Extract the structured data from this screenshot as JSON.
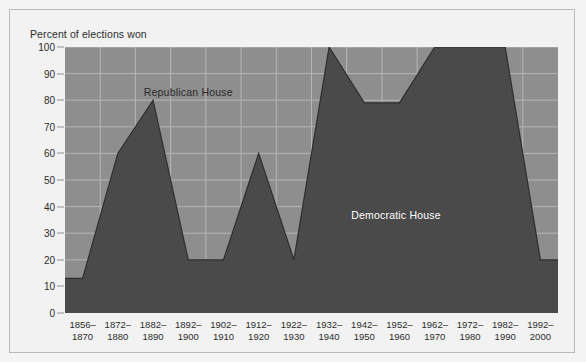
{
  "figure": {
    "background_color": "#f2f2f2",
    "border_color": "#b9b9b9"
  },
  "chart_data": {
    "type": "area",
    "title": "",
    "axis_title": "Percent of elections won",
    "xlabel": "",
    "ylabel": "Percent of elections won",
    "ylim": [
      0,
      100
    ],
    "ytick_values": [
      0,
      10,
      20,
      30,
      40,
      50,
      60,
      70,
      80,
      90,
      100
    ],
    "ytick_labels": [
      "0",
      "10",
      "20",
      "30",
      "40",
      "50",
      "60",
      "70",
      "80",
      "90",
      "100"
    ],
    "grid": true,
    "legend_position": "inline-annotation",
    "categories": [
      "1856–\n1870",
      "1872–\n1880",
      "1882–\n1890",
      "1892–\n1900",
      "1902–\n1910",
      "1912–\n1920",
      "1922–\n1930",
      "1932–\n1940",
      "1942–\n1950",
      "1952–\n1960",
      "1962–\n1970",
      "1972–\n1980",
      "1982–\n1990",
      "1992–\n2000"
    ],
    "categories_flat": [
      "1856–1870",
      "1872–1880",
      "1882–1890",
      "1892–1900",
      "1902–1910",
      "1912–1920",
      "1922–1930",
      "1932–1940",
      "1942–1950",
      "1952–1960",
      "1962–1970",
      "1972–1980",
      "1982–1990",
      "1992–2000"
    ],
    "series": [
      {
        "name": "Democratic House",
        "color": "#4a4a4a",
        "text_color": "#ffffff",
        "values": [
          13,
          60,
          80,
          20,
          20,
          60,
          20,
          100,
          79,
          79,
          100,
          100,
          100,
          20
        ]
      },
      {
        "name": "Republican House",
        "color": "#8e8e8e",
        "text_color": "#2a2a2a",
        "values": [
          87,
          40,
          20,
          80,
          80,
          40,
          80,
          0,
          21,
          21,
          0,
          0,
          0,
          80
        ]
      }
    ],
    "annotations": [
      {
        "text": "Republican House",
        "x_index": 3.0,
        "y_value": 83,
        "series": "Republican House"
      },
      {
        "text": "Democratic House",
        "x_index": 8.9,
        "y_value": 37,
        "series": "Democratic House"
      }
    ]
  }
}
